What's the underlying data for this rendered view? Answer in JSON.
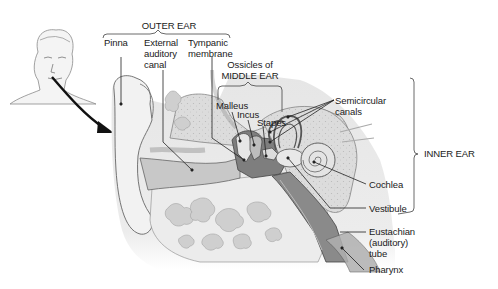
{
  "diagram": {
    "colors": {
      "bone_fill": "#d9d9d9",
      "bone_speckle": "#bdbdbd",
      "soft_tissue": "#efefef",
      "dark_tissue": "#7a7a7a",
      "mid_gray": "#9e9e9e",
      "outline": "#555555",
      "leader": "#222222",
      "arrow": "#111111"
    },
    "groups": [
      {
        "id": "outer",
        "label": "OUTER EAR"
      },
      {
        "id": "middle",
        "label": "Ossicles of\nMIDDLE EAR"
      },
      {
        "id": "inner",
        "label": "INNER EAR"
      }
    ],
    "labels": [
      {
        "id": "pinna",
        "text": "Pinna"
      },
      {
        "id": "external-auditory-canal",
        "text": "External\nauditory\ncanal"
      },
      {
        "id": "tympanic-membrane",
        "text": "Tympanic\nmembrane"
      },
      {
        "id": "malleus",
        "text": "Malleus"
      },
      {
        "id": "incus",
        "text": "Incus"
      },
      {
        "id": "stapes",
        "text": "Stapes"
      },
      {
        "id": "semicircular-canals",
        "text": "Semicircular\ncanals"
      },
      {
        "id": "cochlea",
        "text": "Cochlea"
      },
      {
        "id": "vestibule",
        "text": "Vestibule"
      },
      {
        "id": "eustachian-tube",
        "text": "Eustachian\n(auditory)\ntube"
      },
      {
        "id": "pharynx",
        "text": "Pharynx"
      }
    ]
  }
}
